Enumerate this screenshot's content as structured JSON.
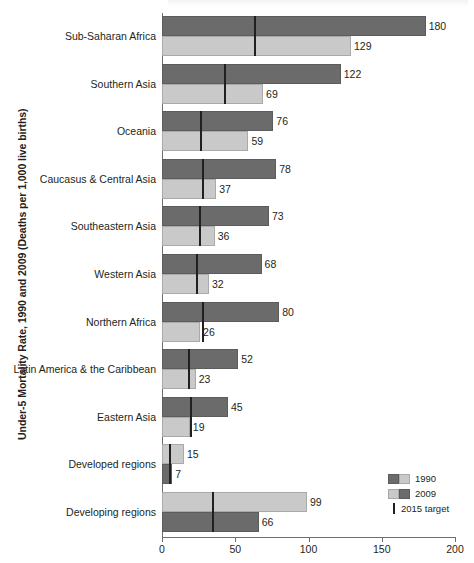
{
  "chart_data": {
    "type": "bar",
    "orientation": "horizontal",
    "title": "",
    "ylabel": "Under-5 Mortality Rate, 1990 and 2009 (Deaths per 1,000 live births)",
    "xlabel": "",
    "xlim": [
      0,
      200
    ],
    "xticks": [
      0,
      50,
      100,
      150,
      200
    ],
    "xtick_labels": [
      "0",
      "50",
      "100",
      "150",
      "200"
    ],
    "grid": false,
    "legend_position": "bottom-right",
    "categories": [
      "Sub-Saharan Africa",
      "Southern Asia",
      "Oceania",
      "Caucasus & Central Asia",
      "Southeastern Asia",
      "Western Asia",
      "Northern Africa",
      "Latin America & the Caribbean",
      "Eastern Asia",
      "Developed regions",
      "Developing regions"
    ],
    "series": [
      {
        "name": "1990",
        "color": "#6b6b6b",
        "values": [
          180,
          122,
          76,
          78,
          73,
          68,
          80,
          52,
          45,
          15,
          99
        ]
      },
      {
        "name": "2009",
        "color": "#c9c9c9",
        "values": [
          129,
          69,
          59,
          37,
          36,
          32,
          26,
          23,
          19,
          7,
          66
        ]
      }
    ],
    "target_marker": {
      "name": "2015 target",
      "color": "#231f20",
      "values": [
        63,
        42,
        26,
        27,
        25,
        23,
        27,
        18,
        19,
        5,
        34
      ]
    },
    "rows": [
      {
        "label": "Sub-Saharan Africa",
        "top_value": 180,
        "top_series": "1990",
        "top_shade": "dark",
        "bottom_value": 129,
        "bottom_series": "2009",
        "bottom_shade": "light",
        "target": 63
      },
      {
        "label": "Southern Asia",
        "top_value": 122,
        "top_series": "1990",
        "top_shade": "dark",
        "bottom_value": 69,
        "bottom_series": "2009",
        "bottom_shade": "light",
        "target": 42
      },
      {
        "label": "Oceania",
        "top_value": 76,
        "top_series": "1990",
        "top_shade": "dark",
        "bottom_value": 59,
        "bottom_series": "2009",
        "bottom_shade": "light",
        "target": 26
      },
      {
        "label": "Caucasus & Central Asia",
        "top_value": 78,
        "top_series": "1990",
        "top_shade": "dark",
        "bottom_value": 37,
        "bottom_series": "2009",
        "bottom_shade": "light",
        "target": 27
      },
      {
        "label": "Southeastern Asia",
        "top_value": 73,
        "top_series": "1990",
        "top_shade": "dark",
        "bottom_value": 36,
        "bottom_series": "2009",
        "bottom_shade": "light",
        "target": 25
      },
      {
        "label": "Western Asia",
        "top_value": 68,
        "top_series": "1990",
        "top_shade": "dark",
        "bottom_value": 32,
        "bottom_series": "2009",
        "bottom_shade": "light",
        "target": 23
      },
      {
        "label": "Northern Africa",
        "top_value": 80,
        "top_series": "1990",
        "top_shade": "dark",
        "bottom_value": 26,
        "bottom_series": "2009",
        "bottom_shade": "light",
        "target": 27
      },
      {
        "label": "Latin America & the Caribbean",
        "top_value": 52,
        "top_series": "1990",
        "top_shade": "dark",
        "bottom_value": 23,
        "bottom_series": "2009",
        "bottom_shade": "light",
        "target": 18
      },
      {
        "label": "Eastern Asia",
        "top_value": 45,
        "top_series": "1990",
        "top_shade": "dark",
        "bottom_value": 19,
        "bottom_series": "2009",
        "bottom_shade": "light",
        "target": 19
      },
      {
        "label": "Developed regions",
        "top_value": 15,
        "top_series": "1990",
        "top_shade": "light",
        "bottom_value": 7,
        "bottom_series": "2009",
        "bottom_shade": "dark",
        "target": 5
      },
      {
        "label": "Developing regions",
        "top_value": 99,
        "top_series": "1990",
        "top_shade": "light",
        "bottom_value": 66,
        "bottom_series": "2009",
        "bottom_shade": "dark",
        "target": 34
      }
    ],
    "legend": [
      {
        "label": "1990",
        "swatches": [
          "dark",
          "light"
        ]
      },
      {
        "label": "2009",
        "swatches": [
          "light",
          "dark"
        ]
      },
      {
        "label": "2015 target",
        "swatches": [
          "tick"
        ]
      }
    ]
  }
}
